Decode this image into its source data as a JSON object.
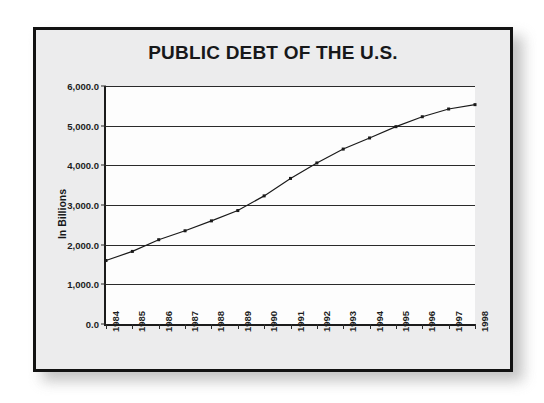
{
  "chart_data": {
    "type": "line",
    "title": "PUBLIC DEBT OF THE U.S.",
    "xlabel": "",
    "ylabel": "In Billions",
    "ylim": [
      0,
      6000
    ],
    "ytick_labels": [
      "0.0",
      "1,000.0",
      "2,000.0",
      "3,000.0",
      "4,000.0",
      "5,000.0",
      "6,000.0"
    ],
    "ytick_values": [
      0,
      1000,
      2000,
      3000,
      4000,
      5000,
      6000
    ],
    "grid": true,
    "legend": false,
    "legend_position": "none",
    "marker": "small-square",
    "line_color": "#1a1a1a",
    "categories": [
      "1984",
      "1985",
      "1986",
      "1987",
      "1988",
      "1989",
      "1990",
      "1991",
      "1992",
      "1993",
      "1994",
      "1995",
      "1996",
      "1997",
      "1998"
    ],
    "x": [
      1984,
      1985,
      1986,
      1987,
      1988,
      1989,
      1990,
      1991,
      1992,
      1993,
      1994,
      1995,
      1996,
      1997,
      1998
    ],
    "values": [
      1600,
      1830,
      2125,
      2350,
      2600,
      2860,
      3230,
      3670,
      4060,
      4410,
      4690,
      4975,
      5225,
      5420,
      5530
    ],
    "series": [
      {
        "name": "Public Debt",
        "values": [
          1600,
          1830,
          2125,
          2350,
          2600,
          2860,
          3230,
          3670,
          4060,
          4410,
          4690,
          4975,
          5225,
          5420,
          5530
        ]
      }
    ]
  },
  "colors": {
    "panel_background": "#ececed",
    "plot_background": "#fdfdfd",
    "frame_border": "#121212",
    "axis": "#1b1b1b",
    "gridline": "#2a2a2a",
    "text": "#17181a"
  }
}
